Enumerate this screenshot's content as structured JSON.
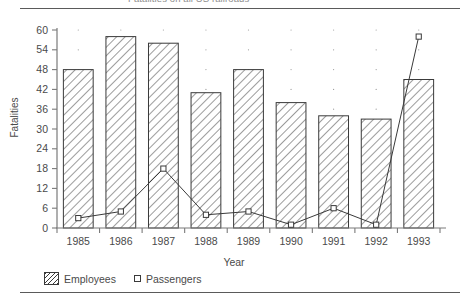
{
  "figure": {
    "title_clipped": "Fatalities on all US railroads",
    "title_visible": false
  },
  "axes": {
    "ylabel": "Fatalities",
    "xlabel": "Year",
    "yticks": [
      0,
      6,
      12,
      18,
      24,
      30,
      36,
      42,
      48,
      54,
      60
    ],
    "ylim": [
      0,
      60
    ],
    "xticks": [
      "1985",
      "1986",
      "1987",
      "1988",
      "1989",
      "1990",
      "1991",
      "1992",
      "1993"
    ]
  },
  "legend": {
    "position": "below-axes-left",
    "entries": [
      {
        "label": "Employees",
        "marker": "hatched-bar"
      },
      {
        "label": "Passengers",
        "marker": "open-square-line"
      }
    ]
  },
  "colors": {
    "ink": "#3a3a3a",
    "axis": "#7a7a7a",
    "text": "#4a4a4a",
    "grid_dot": "#9a9a9a",
    "background": "#ffffff"
  },
  "chart_data": {
    "type": "bar",
    "title": "Fatalities on all US railroads",
    "xlabel": "Year",
    "ylabel": "Fatalities",
    "categories": [
      "1985",
      "1986",
      "1987",
      "1988",
      "1989",
      "1990",
      "1991",
      "1992",
      "1993"
    ],
    "ylim": [
      0,
      60
    ],
    "yticks": [
      0,
      6,
      12,
      18,
      24,
      30,
      36,
      42,
      48,
      54,
      60
    ],
    "grid": "dotted-points",
    "legend_position": "bottom-left",
    "series": [
      {
        "name": "Employees",
        "render": "bar",
        "fill": "diagonal-hatch",
        "values": [
          48,
          58,
          56,
          41,
          48,
          38,
          34,
          33,
          45
        ]
      },
      {
        "name": "Passengers",
        "render": "line-marker",
        "marker": "open-square",
        "values": [
          3,
          5,
          18,
          4,
          5,
          1,
          6,
          1,
          58
        ]
      }
    ]
  }
}
